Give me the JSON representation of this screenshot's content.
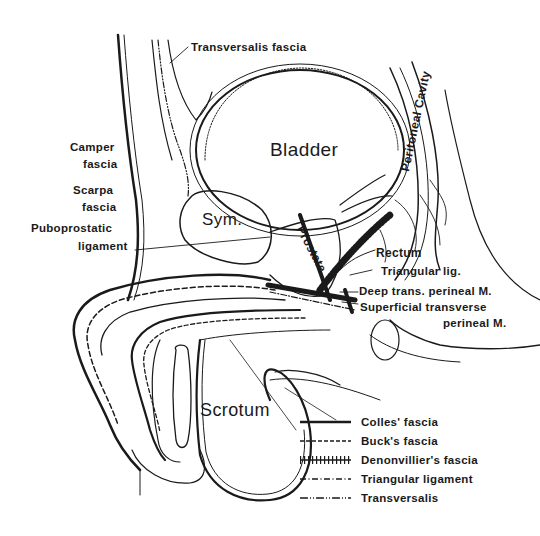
{
  "figure": {
    "type": "anatomical sagittal section",
    "structures": {
      "bladder": "Bladder",
      "symphysis": "Sym.",
      "prostate": "Prostate",
      "rectum": "Rectum",
      "scrotum": "Scrotum",
      "peritoneal_cavity": "Peritoneal Cavity"
    },
    "labels": {
      "transversalis_fascia": "Transversalis fascia",
      "camper_fascia_1": "Camper",
      "camper_fascia_2": "fascia",
      "scarpa_fascia_1": "Scarpa",
      "scarpa_fascia_2": "fascia",
      "puboprostatic_1": "Puboprostatic",
      "puboprostatic_2": "ligament",
      "triangular_lig": "Triangular lig.",
      "deep_trans_perineal": "Deep trans. perineal M.",
      "superficial_transverse_1": "Superficial transverse",
      "superficial_transverse_2": "perineal M."
    },
    "legend": [
      {
        "style": "solid",
        "label": "Colles' fascia"
      },
      {
        "style": "dashed",
        "label": "Buck's fascia"
      },
      {
        "style": "hatched",
        "label": "Denonvillier's fascia"
      },
      {
        "style": "dash-dot",
        "label": "Triangular ligament"
      },
      {
        "style": "dash-dot-dot",
        "label": "Transversalis"
      }
    ],
    "colors": {
      "ink": "#1a1a1a",
      "background": "#ffffff"
    }
  }
}
